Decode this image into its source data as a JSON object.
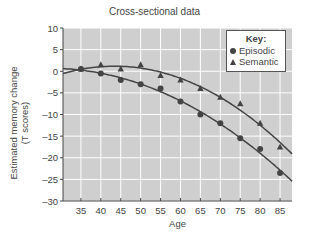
{
  "chart_data": {
    "type": "scatter",
    "title": "Cross-sectional data",
    "xlabel": "Age",
    "ylabel": "Estimated memory change (T scores)",
    "ylabel_lines": [
      "Estimated memory change",
      "(T scores)"
    ],
    "x": [
      35,
      40,
      45,
      50,
      55,
      60,
      65,
      70,
      75,
      80,
      85
    ],
    "xticks": [
      "35",
      "40",
      "45",
      "50",
      "55",
      "60",
      "65",
      "70",
      "75",
      "80",
      "85"
    ],
    "yticks": [
      "10",
      "5",
      "0",
      "-5",
      "-10",
      "-15",
      "-20",
      "-25",
      "-30"
    ],
    "xlim": [
      30.5,
      88
    ],
    "ylim": [
      -30,
      10
    ],
    "grid": true,
    "legend_position": "upper right",
    "legend_title": "Key:",
    "series": [
      {
        "name": "Episodic",
        "marker": "circle",
        "values": [
          0.5,
          -0.5,
          -2,
          -3,
          -4,
          -7,
          -10,
          -12,
          -15.5,
          -18,
          -23.5
        ],
        "fit": "quadratic"
      },
      {
        "name": "Semantic",
        "marker": "triangle",
        "values": [
          0.5,
          1.5,
          0.5,
          1.5,
          -1,
          -2,
          -4,
          -6,
          -7.5,
          -12,
          -17.5
        ],
        "fit": "quadratic"
      }
    ],
    "colors": {
      "plot_bg": "#cfcfcf",
      "grid": "#ffffff",
      "series": "#444444"
    }
  }
}
